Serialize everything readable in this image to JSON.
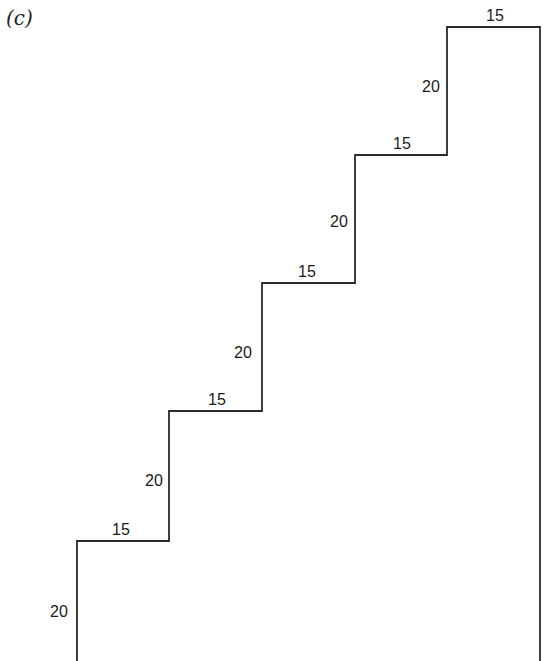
{
  "figure": {
    "panel_label": "(c)",
    "stroke_color": "#2a2a2a",
    "steps": [
      {
        "riser": "20",
        "tread": "15"
      },
      {
        "riser": "20",
        "tread": "15"
      },
      {
        "riser": "20",
        "tread": "15"
      },
      {
        "riser": "20",
        "tread": "15"
      },
      {
        "riser": "20",
        "tread": "15"
      }
    ],
    "labels": {
      "riser_1": "20",
      "tread_1": "15",
      "riser_2": "20",
      "tread_2": "15",
      "riser_3": "20",
      "tread_3": "15",
      "riser_4": "20",
      "tread_4": "15",
      "riser_5": "20",
      "tread_5": "15"
    }
  }
}
